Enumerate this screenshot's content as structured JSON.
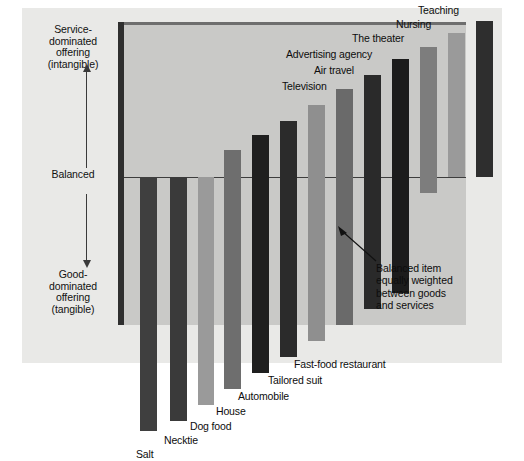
{
  "figure": {
    "background": "#ffffff",
    "panel_color": "#e9e9e7",
    "plot_color": "#c9c9c7"
  },
  "axis": {
    "top_label": "Service-\ndominated\noffering\n(intangible)",
    "mid_label": "Balanced",
    "bottom_label": "Good-\ndominated\noffering\n(tangible)",
    "arrow_up_name": "arrow-up-icon",
    "arrow_down_name": "arrow-down-icon",
    "line_color": "#3a3a3a"
  },
  "annotation": {
    "text": "Balanced item\nequally weighted\nbetween goods\nand services",
    "arrow_name": "annotation-arrow-icon"
  },
  "chart_data": {
    "type": "bar",
    "title": "",
    "subtitle": "",
    "xlabel": "",
    "ylabel": "Service-dominated offering (intangible) / Balanced / Good-dominated offering (tangible)",
    "ylim": [
      -100,
      100
    ],
    "grid": false,
    "legend": "none",
    "zero_line_label": "Balanced",
    "orientation": "vertical",
    "note": "Each bar spans from its goods-dominated extent (negative) to its service-dominated extent (positive); bars ordered from most tangible (Salt) to most intangible (Teaching).",
    "categories": [
      "Salt",
      "Necktie",
      "Dog food",
      "House",
      "Automobile",
      "Tailored suit",
      "Fast-food restaurant",
      "Television",
      "Air travel",
      "Advertising agency",
      "The theater",
      "Nursing",
      "Teaching"
    ],
    "series": [
      {
        "name": "Goods-dominated extent (negative)",
        "values": [
          -96,
          -90,
          -76,
          -62,
          -74,
          -68,
          -50,
          -38,
          -24,
          -6,
          12,
          0,
          0
        ]
      },
      {
        "name": "Service-dominated extent (positive)",
        "values": [
          0,
          0,
          0,
          12,
          24,
          36,
          50,
          62,
          74,
          86,
          90,
          120,
          132
        ]
      }
    ],
    "bar_colors": [
      "#3f3f3f",
      "#3a3a3a",
      "#9a9a9a",
      "#6e6e6e",
      "#1f1f1f",
      "#2b2b2b",
      "#8f8f8f",
      "#6a6a6a",
      "#2a2a2a",
      "#1c1c1c",
      "#7d7d7d",
      "#9a9a9a",
      "#2e2e2e"
    ],
    "bars": [
      {
        "label": "Salt",
        "color": "#3f3f3f",
        "x": 16,
        "w": 17,
        "top": 0,
        "bottom": 254,
        "label_x": 12,
        "label_y": 272
      },
      {
        "label": "Necktie",
        "color": "#3a3a3a",
        "x": 46,
        "w": 17,
        "top": 0,
        "bottom": 244,
        "label_x": 40,
        "label_y": 258
      },
      {
        "label": "Dog food",
        "color": "#9a9a9a",
        "x": 74,
        "w": 16,
        "top": 0,
        "bottom": 228,
        "label_x": 66,
        "label_y": 244
      },
      {
        "label": "House",
        "color": "#6e6e6e",
        "x": 100,
        "w": 17,
        "top": -27,
        "bottom": 212,
        "label_x": 92,
        "label_y": 229
      },
      {
        "label": "Automobile",
        "color": "#1f1f1f",
        "x": 128,
        "w": 17,
        "top": -42,
        "bottom": 196,
        "label_x": 114,
        "label_y": 214
      },
      {
        "label": "Tailored suit",
        "color": "#2b2b2b",
        "x": 156,
        "w": 17,
        "top": -56,
        "bottom": 180,
        "label_x": 144,
        "label_y": 198
      },
      {
        "label": "Fast-food restaurant",
        "color": "#8f8f8f",
        "x": 184,
        "w": 17,
        "top": -72,
        "bottom": 164,
        "label_x": 170,
        "label_y": 182
      },
      {
        "label": "Television",
        "color": "#6a6a6a",
        "x": 212,
        "w": 17,
        "top": -88,
        "bottom": 148,
        "label_x": 158,
        "label_y": -96
      },
      {
        "label": "Air travel",
        "color": "#2a2a2a",
        "x": 240,
        "w": 17,
        "top": -102,
        "bottom": 132,
        "label_x": 190,
        "label_y": -112
      },
      {
        "label": "Advertising agency",
        "color": "#1c1c1c",
        "x": 268,
        "w": 17,
        "top": -118,
        "bottom": 116,
        "label_x": 162,
        "label_y": -128
      },
      {
        "label": "The theater",
        "color": "#7d7d7d",
        "x": 296,
        "w": 17,
        "top": -130,
        "bottom": 16,
        "label_x": 228,
        "label_y": -144
      },
      {
        "label": "Nursing",
        "color": "#9a9a9a",
        "x": 324,
        "w": 17,
        "top": -144,
        "bottom": 0,
        "label_x": 272,
        "label_y": -158
      },
      {
        "label": "Teaching",
        "color": "#2e2e2e",
        "x": 352,
        "w": 17,
        "top": -156,
        "bottom": 0,
        "label_x": 294,
        "label_y": -172
      }
    ]
  }
}
